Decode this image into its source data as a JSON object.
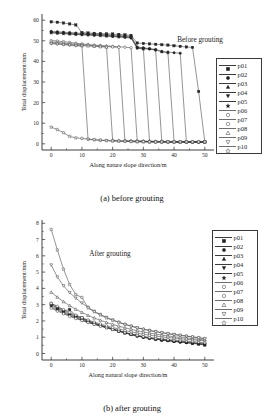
{
  "figure": {
    "panels": [
      {
        "id": "a",
        "caption": "(a) before grouting",
        "annotation": "Before grouting",
        "xlabel": "Along nature slope direction/m",
        "ylabel": "Total displacement/mm"
      },
      {
        "id": "b",
        "caption": "(b) after grouting",
        "annotation": "After grouting",
        "xlabel": "Along natural slope direction/m",
        "ylabel": "Total displacement/mm"
      }
    ]
  },
  "legend": {
    "items": [
      {
        "label": "p01",
        "marker": "filled-square"
      },
      {
        "label": "p02",
        "marker": "filled-circle"
      },
      {
        "label": "p03",
        "marker": "filled-triangle-up"
      },
      {
        "label": "p04",
        "marker": "filled-triangle-down"
      },
      {
        "label": "p05",
        "marker": "filled-star"
      },
      {
        "label": "p06",
        "marker": "open-circle"
      },
      {
        "label": "p07",
        "marker": "open-circle"
      },
      {
        "label": "p08",
        "marker": "open-triangle-up"
      },
      {
        "label": "p09",
        "marker": "open-triangle-down"
      },
      {
        "label": "p10",
        "marker": "open-star"
      }
    ]
  },
  "chart_data": [
    {
      "type": "line",
      "panel": "a",
      "title": "(a) before grouting",
      "annotation": "Before grouting",
      "xlabel": "Along nature slope direction/m",
      "ylabel": "Total displacement/mm",
      "xlim": [
        -3,
        53
      ],
      "ylim": [
        -3,
        63
      ],
      "xticks": [
        0,
        10,
        20,
        30,
        40,
        50
      ],
      "yticks": [
        0,
        10,
        20,
        30,
        40,
        50,
        60
      ],
      "grid": false,
      "legend_position": "right",
      "x": [
        0,
        2,
        4,
        6,
        8,
        10,
        12,
        14,
        16,
        18,
        20,
        22,
        24,
        26,
        28,
        30,
        32,
        34,
        36,
        38,
        40,
        42,
        44,
        46,
        48,
        50
      ],
      "series": [
        {
          "name": "p01",
          "marker": "filled-square",
          "values": [
            59.2,
            59.0,
            58.6,
            58.2,
            57.7,
            54.0,
            53.8,
            53.6,
            53.5,
            53.4,
            53.3,
            53.1,
            52.9,
            52.6,
            48.9,
            48.7,
            48.5,
            48.3,
            48.1,
            47.9,
            47.6,
            47.3,
            47.0,
            46.8,
            25.4,
            0.9
          ]
        },
        {
          "name": "p02",
          "marker": "filled-circle",
          "values": [
            54.6,
            54.4,
            54.2,
            54.0,
            53.8,
            53.6,
            53.4,
            53.3,
            53.2,
            53.0,
            52.8,
            52.6,
            52.4,
            52.1,
            47.0,
            46.6,
            46.2,
            45.8,
            44.9,
            44.5,
            44.2,
            44.0,
            1.0,
            0.9,
            0.9,
            0.9
          ]
        },
        {
          "name": "p03",
          "marker": "filled-triangle-up",
          "values": [
            54.2,
            54.0,
            53.8,
            53.6,
            53.4,
            53.2,
            53.1,
            53.0,
            52.8,
            52.6,
            52.4,
            52.2,
            52.0,
            51.8,
            46.8,
            46.4,
            46.0,
            45.6,
            44.6,
            44.2,
            1.1,
            1.0,
            1.0,
            0.9,
            0.9,
            0.9
          ]
        },
        {
          "name": "p04",
          "marker": "filled-triangle-down",
          "values": [
            54.0,
            53.8,
            53.6,
            53.4,
            53.2,
            53.0,
            52.9,
            52.8,
            52.6,
            52.4,
            52.2,
            52.0,
            51.8,
            51.5,
            46.5,
            46.1,
            46.0,
            45.4,
            1.2,
            1.1,
            1.0,
            1.0,
            0.9,
            0.9,
            0.9,
            0.9
          ]
        },
        {
          "name": "p05",
          "marker": "filled-star",
          "values": [
            53.8,
            53.6,
            53.4,
            53.2,
            53.0,
            52.9,
            52.8,
            52.6,
            52.4,
            52.2,
            52.0,
            51.8,
            51.6,
            51.3,
            46.4,
            46.0,
            1.3,
            1.2,
            1.1,
            1.0,
            1.0,
            0.9,
            0.9,
            0.9,
            0.9,
            0.9
          ]
        },
        {
          "name": "p06",
          "marker": "open-circle",
          "values": [
            50.1,
            49.9,
            49.6,
            49.2,
            48.8,
            48.5,
            48.2,
            47.9,
            47.7,
            47.5,
            47.3,
            47.1,
            46.9,
            46.6,
            1.4,
            1.3,
            1.2,
            1.1,
            1.0,
            1.0,
            0.9,
            0.9,
            0.9,
            0.9,
            0.9,
            0.9
          ]
        },
        {
          "name": "p07",
          "marker": "open-circle",
          "values": [
            49.4,
            49.2,
            48.9,
            48.6,
            48.3,
            48.0,
            47.8,
            47.6,
            47.4,
            47.2,
            47.0,
            46.8,
            1.5,
            1.4,
            1.3,
            1.2,
            1.1,
            1.0,
            1.0,
            0.9,
            0.9,
            0.9,
            0.9,
            0.9,
            0.9,
            0.9
          ]
        },
        {
          "name": "p08",
          "marker": "open-triangle-up",
          "values": [
            48.9,
            48.7,
            48.4,
            48.1,
            47.9,
            47.7,
            47.5,
            47.3,
            47.1,
            46.9,
            1.7,
            1.5,
            1.4,
            1.3,
            1.2,
            1.1,
            1.0,
            1.0,
            0.9,
            0.9,
            0.9,
            0.9,
            0.9,
            0.9,
            0.9,
            0.9
          ]
        },
        {
          "name": "p09",
          "marker": "open-triangle-down",
          "values": [
            48.6,
            48.4,
            48.1,
            47.9,
            47.6,
            47.4,
            2.1,
            1.9,
            1.7,
            1.5,
            1.4,
            1.3,
            1.2,
            1.1,
            1.0,
            1.0,
            0.9,
            0.9,
            0.9,
            0.9,
            0.9,
            0.9,
            0.9,
            0.9,
            0.9,
            0.9
          ]
        },
        {
          "name": "p10",
          "marker": "open-star",
          "values": [
            8.1,
            6.9,
            5.4,
            3.6,
            2.9,
            2.6,
            2.3,
            2.0,
            1.8,
            1.6,
            1.4,
            1.3,
            1.2,
            1.1,
            1.0,
            1.0,
            0.9,
            0.9,
            0.9,
            0.9,
            0.9,
            0.9,
            0.9,
            0.9,
            0.9,
            0.9
          ]
        }
      ]
    },
    {
      "type": "line",
      "panel": "b",
      "title": "(b) after grouting",
      "annotation": "After grouting",
      "xlabel": "Along natural slope direction/m",
      "ylabel": "Total displacement/mm",
      "xlim": [
        -3,
        53
      ],
      "ylim": [
        -0.4,
        8.2
      ],
      "xticks": [
        0,
        10,
        20,
        30,
        40,
        50
      ],
      "yticks": [
        0,
        1,
        2,
        3,
        4,
        5,
        6,
        7,
        8
      ],
      "grid": false,
      "legend_position": "right",
      "x": [
        0,
        2,
        4,
        6,
        8,
        10,
        12,
        14,
        16,
        18,
        20,
        22,
        24,
        26,
        28,
        30,
        32,
        34,
        36,
        38,
        40,
        42,
        44,
        46,
        48,
        50
      ],
      "series": [
        {
          "name": "p01",
          "marker": "filled-square",
          "values": [
            3.05,
            2.8,
            2.62,
            2.7,
            2.34,
            2.18,
            2.0,
            1.86,
            1.74,
            1.62,
            1.5,
            1.38,
            1.27,
            1.17,
            1.08,
            1.0,
            0.94,
            0.88,
            0.83,
            0.79,
            0.75,
            0.71,
            0.67,
            0.63,
            0.58,
            0.52
          ]
        },
        {
          "name": "p02",
          "marker": "filled-circle",
          "values": [
            3.0,
            2.78,
            2.58,
            2.4,
            2.26,
            2.12,
            1.97,
            1.84,
            1.72,
            1.6,
            1.49,
            1.37,
            1.26,
            1.16,
            1.07,
            0.99,
            0.93,
            0.87,
            0.82,
            0.78,
            0.74,
            0.7,
            0.66,
            0.62,
            0.58,
            0.53
          ]
        },
        {
          "name": "p03",
          "marker": "filled-triangle-up",
          "values": [
            3.1,
            2.86,
            2.66,
            2.46,
            2.3,
            2.15,
            2.0,
            1.87,
            1.75,
            1.63,
            1.52,
            1.4,
            1.29,
            1.19,
            1.1,
            1.02,
            0.95,
            0.89,
            0.84,
            0.8,
            0.76,
            0.72,
            0.68,
            0.64,
            0.6,
            0.55
          ]
        },
        {
          "name": "p04",
          "marker": "filled-triangle-down",
          "values": [
            2.92,
            2.72,
            2.52,
            2.35,
            2.2,
            2.06,
            1.93,
            1.81,
            1.7,
            1.59,
            1.48,
            1.37,
            1.27,
            1.17,
            1.08,
            1.0,
            0.94,
            0.89,
            0.84,
            0.8,
            0.76,
            0.72,
            0.69,
            0.65,
            0.61,
            0.57
          ]
        },
        {
          "name": "p05",
          "marker": "filled-star",
          "values": [
            2.84,
            2.66,
            2.48,
            2.32,
            2.18,
            2.04,
            1.92,
            1.8,
            1.69,
            1.58,
            1.47,
            1.37,
            1.27,
            1.18,
            1.09,
            1.02,
            0.96,
            0.9,
            0.86,
            0.82,
            0.78,
            0.74,
            0.7,
            0.67,
            0.63,
            0.59
          ]
        },
        {
          "name": "p06",
          "marker": "open-circle",
          "values": [
            2.78,
            2.6,
            2.44,
            2.28,
            2.15,
            2.02,
            1.9,
            1.79,
            1.68,
            1.58,
            1.48,
            1.38,
            1.29,
            1.2,
            1.12,
            1.05,
            0.99,
            0.94,
            0.9,
            0.86,
            0.82,
            0.79,
            0.76,
            0.73,
            0.7,
            0.66
          ]
        },
        {
          "name": "p07",
          "marker": "open-circle",
          "values": [
            3.08,
            2.9,
            2.7,
            2.52,
            2.36,
            2.2,
            2.06,
            1.93,
            1.81,
            1.7,
            1.6,
            1.5,
            1.41,
            1.33,
            1.25,
            1.18,
            1.12,
            1.07,
            1.02,
            0.98,
            0.94,
            0.9,
            0.87,
            0.84,
            0.81,
            0.78
          ]
        },
        {
          "name": "p08",
          "marker": "open-triangle-up",
          "values": [
            3.76,
            3.46,
            3.18,
            2.94,
            2.72,
            2.52,
            2.34,
            2.18,
            2.04,
            1.91,
            1.79,
            1.68,
            1.58,
            1.49,
            1.4,
            1.32,
            1.25,
            1.19,
            1.13,
            1.08,
            1.03,
            0.99,
            0.95,
            0.91,
            0.87,
            0.83
          ]
        },
        {
          "name": "p09",
          "marker": "open-triangle-down",
          "values": [
            5.44,
            4.7,
            4.16,
            3.74,
            3.4,
            3.1,
            2.84,
            2.6,
            2.4,
            2.22,
            2.06,
            1.92,
            1.79,
            1.68,
            1.58,
            1.49,
            1.41,
            1.34,
            1.27,
            1.21,
            1.16,
            1.11,
            1.06,
            1.01,
            0.96,
            0.9
          ]
        },
        {
          "name": "p10",
          "marker": "open-star",
          "values": [
            7.62,
            6.36,
            5.18,
            4.24,
            3.62,
            3.44,
            2.8,
            2.56,
            2.36,
            2.18,
            2.04,
            1.91,
            1.79,
            1.68,
            1.58,
            1.49,
            1.41,
            1.34,
            1.28,
            1.22,
            1.17,
            1.12,
            1.07,
            1.02,
            0.97,
            0.92
          ]
        }
      ]
    }
  ]
}
